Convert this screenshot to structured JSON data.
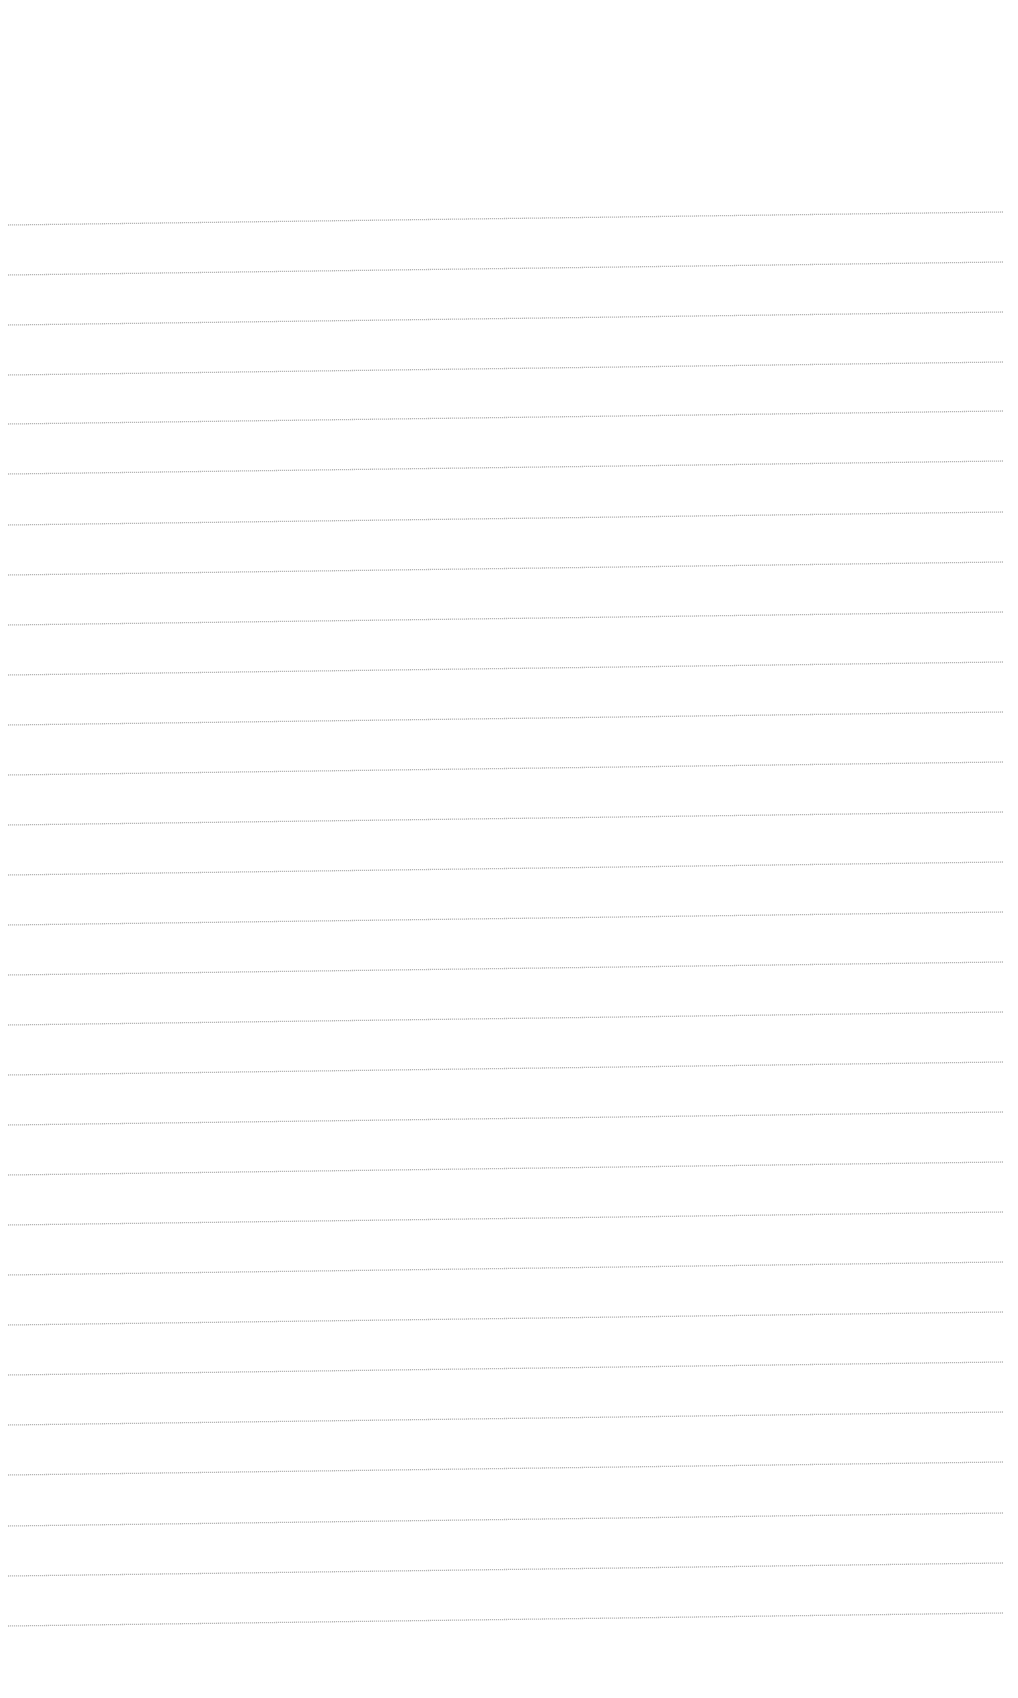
{
  "page": {
    "type": "lined-paper",
    "background_color": "#ffffff",
    "line_color": "#a9a9a9",
    "line_count": 29,
    "line_spacing_px": 50,
    "line_x_start": 8,
    "line_x_end": 1003,
    "line_rise_px": 13,
    "lines_left_y": [
      225,
      275,
      325,
      375,
      424,
      474,
      525,
      575,
      625,
      675,
      725,
      775,
      825,
      875,
      925,
      975,
      1025,
      1075,
      1125,
      1175,
      1225,
      1275,
      1325,
      1375,
      1425,
      1475,
      1526,
      1576,
      1626
    ],
    "text_content": ""
  }
}
